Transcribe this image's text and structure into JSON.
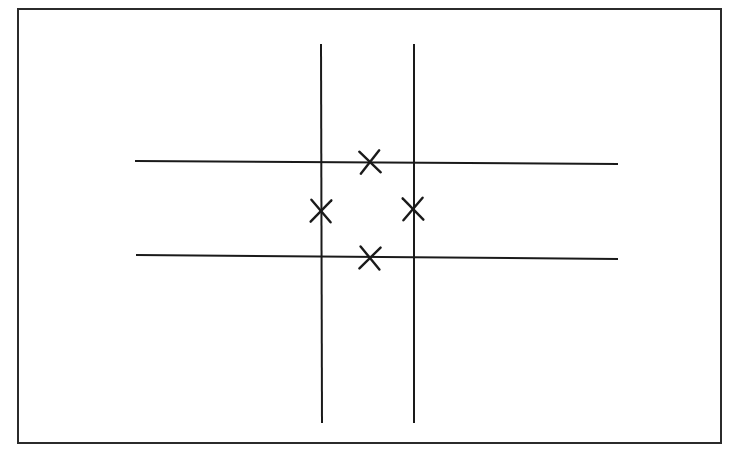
{
  "document": {
    "title": "Tic-Tac-Toe Grid Diagram",
    "background_color": "#ffffff",
    "ink_color": "#1a1a1a",
    "width": 734,
    "height": 455
  },
  "frame": {
    "label": "page-border",
    "x": 17,
    "y": 8,
    "width": 705,
    "height": 436,
    "stroke_width": 2,
    "color": "#2b2b2b"
  },
  "chart_data": {
    "type": "diagram",
    "subtitle": "",
    "grid_on": true,
    "legend": "none",
    "xlabel": "",
    "ylabel": "",
    "xlim": [
      0,
      734
    ],
    "ylim": [
      0,
      455
    ],
    "vertical_lines": [
      {
        "name": "vertical-line-left",
        "x1": 321,
        "y1": 44,
        "x2": 322,
        "y2": 423,
        "stroke_width": 2.0
      },
      {
        "name": "vertical-line-right",
        "x1": 414,
        "y1": 44,
        "x2": 414,
        "y2": 423,
        "stroke_width": 2.0
      }
    ],
    "horizontal_lines": [
      {
        "name": "horizontal-line-top",
        "x1": 135,
        "y1": 161,
        "x2": 618,
        "y2": 164,
        "stroke_width": 2.0
      },
      {
        "name": "horizontal-line-bottom",
        "x1": 136,
        "y1": 255,
        "x2": 618,
        "y2": 259,
        "stroke_width": 2.0
      }
    ],
    "marks": [
      {
        "name": "x-mark-top-center",
        "symbol": "X",
        "cx": 370,
        "cy": 162,
        "half_width": 10,
        "half_height": 11,
        "rotation": -4,
        "stroke_width": 2.4,
        "cell": "top-center"
      },
      {
        "name": "x-mark-middle-left",
        "symbol": "X",
        "cx": 321,
        "cy": 211,
        "half_width": 10,
        "half_height": 11,
        "rotation": 2,
        "stroke_width": 2.4,
        "cell": "middle-left"
      },
      {
        "name": "x-mark-middle-right",
        "symbol": "X",
        "cx": 413,
        "cy": 209,
        "half_width": 10,
        "half_height": 11,
        "rotation": -2,
        "stroke_width": 2.4,
        "cell": "middle-right"
      },
      {
        "name": "x-mark-bottom-center",
        "symbol": "X",
        "cx": 370,
        "cy": 258,
        "half_width": 10,
        "half_height": 11,
        "rotation": 3,
        "stroke_width": 2.4,
        "cell": "bottom-center"
      }
    ],
    "mark_count": 4,
    "line_count": 4
  }
}
